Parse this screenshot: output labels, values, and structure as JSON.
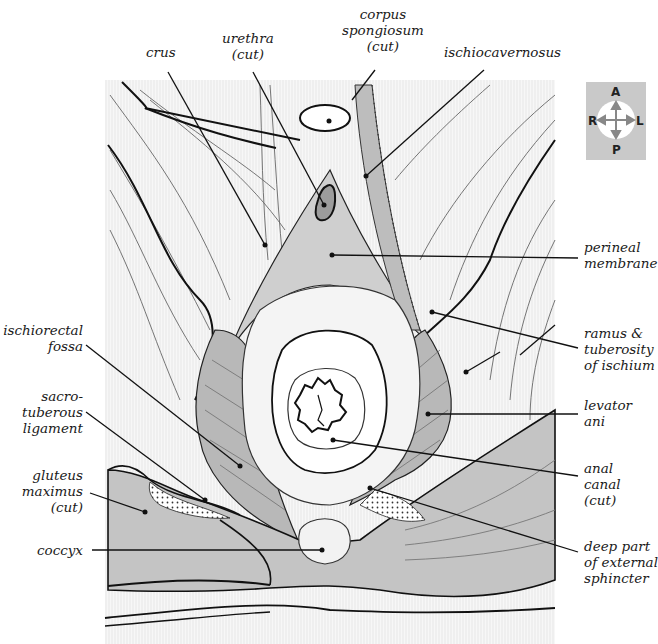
{
  "diagram": {
    "colors": {
      "background": "#ffffff",
      "tissue_gray": "#c4c4c4",
      "light_gray": "#dcdcdc",
      "line": "#1a1a1a",
      "orientation_box": "#c9c9c9"
    },
    "orientation": {
      "anterior": "A",
      "posterior": "P",
      "right": "R",
      "left": "L"
    },
    "labels_top": [
      {
        "id": "crus",
        "text": "crus"
      },
      {
        "id": "urethra",
        "text": "urethra\n(cut)"
      },
      {
        "id": "corpus_spongiosum",
        "text": "corpus\nspongiosum\n(cut)"
      },
      {
        "id": "ischiocavernosus",
        "text": "ischiocavernosus"
      }
    ],
    "labels_right": [
      {
        "id": "perineal_membrane",
        "text": "perineal\nmembrane"
      },
      {
        "id": "ramus_tuberosity",
        "text": "ramus &\ntuberosity\nof ischium"
      },
      {
        "id": "levator_ani",
        "text": "levator\nani"
      },
      {
        "id": "anal_canal",
        "text": "anal\ncanal\n(cut)"
      },
      {
        "id": "deep_external_sphincter",
        "text": "deep part\nof external\nsphincter"
      }
    ],
    "labels_left": [
      {
        "id": "ischiorectal_fossa",
        "text": "ischiorectal\nfossa"
      },
      {
        "id": "sacrotuberous_ligament",
        "text": "sacro-\ntuberous\nligament"
      },
      {
        "id": "gluteus_maximus",
        "text": "gluteus\nmaximus\n(cut)"
      },
      {
        "id": "coccyx",
        "text": "coccyx"
      }
    ]
  }
}
